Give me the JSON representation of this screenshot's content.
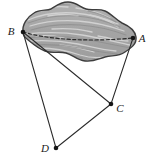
{
  "figure": {
    "name": "solid-region-with-points-diagram",
    "background_color": "#ffffff",
    "width": 153,
    "height": 161,
    "region": {
      "name": "shaded-cloud-region",
      "fill_color": "#a8a8a8",
      "outline_color": "#404040",
      "highlight_color": "#d8d8d8",
      "texture": "striated-horizontal-streaks"
    },
    "chord": {
      "name": "dashed-chord-BA",
      "style": "dashed",
      "color": "#2b2b2b",
      "from": "B",
      "to": "A"
    },
    "vertices": [
      {
        "id": "A",
        "label": "A",
        "x": 133,
        "y": 38,
        "label_x": 141,
        "label_y": 42
      },
      {
        "id": "B",
        "label": "B",
        "x": 23,
        "y": 32,
        "label_x": 11,
        "label_y": 34
      },
      {
        "id": "C",
        "label": "C",
        "x": 111,
        "y": 104,
        "label_x": 118,
        "label_y": 110
      },
      {
        "id": "D",
        "label": "D",
        "x": 56,
        "y": 148,
        "label_x": 43,
        "label_y": 150
      }
    ],
    "edges": [
      {
        "name": "edge-B-C",
        "from": "B",
        "to": "C",
        "color": "#2b2b2b"
      },
      {
        "name": "edge-B-D",
        "from": "B",
        "to": "D",
        "color": "#2b2b2b"
      },
      {
        "name": "edge-A-C",
        "from": "A",
        "to": "C",
        "color": "#2b2b2b"
      },
      {
        "name": "edge-D-C",
        "from": "D",
        "to": "C",
        "color": "#2b2b2b"
      }
    ],
    "point_marker_color": "#151515"
  }
}
